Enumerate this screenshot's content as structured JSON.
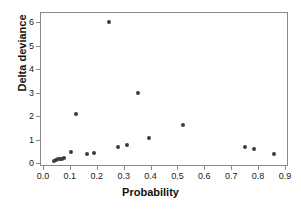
{
  "chart_data": {
    "type": "scatter",
    "title": "",
    "xlabel": "Probability",
    "ylabel": "Delta deviance",
    "xlim": [
      0.0,
      0.9
    ],
    "ylim": [
      0,
      6
    ],
    "xticks": [
      "0.0",
      "0.1",
      "0.2",
      "0.3",
      "0.4",
      "0.5",
      "0.6",
      "0.7",
      "0.8",
      "0.9"
    ],
    "xtick_values": [
      0.0,
      0.1,
      0.2,
      0.3,
      0.4,
      0.5,
      0.6,
      0.7,
      0.8,
      0.9
    ],
    "yticks": [
      "0",
      "1",
      "2",
      "3",
      "4",
      "5",
      "6"
    ],
    "ytick_values": [
      0,
      1,
      2,
      3,
      4,
      5,
      6
    ],
    "grid": false,
    "legend": false,
    "marker_color": "#3d3d3d",
    "frame_color": "#8a8a8a",
    "points": [
      {
        "x": 0.042,
        "y": 0.1
      },
      {
        "x": 0.05,
        "y": 0.13
      },
      {
        "x": 0.057,
        "y": 0.15
      },
      {
        "x": 0.063,
        "y": 0.17
      },
      {
        "x": 0.07,
        "y": 0.19
      },
      {
        "x": 0.077,
        "y": 0.21
      },
      {
        "x": 0.105,
        "y": 0.47
      },
      {
        "x": 0.123,
        "y": 2.1
      },
      {
        "x": 0.163,
        "y": 0.38
      },
      {
        "x": 0.19,
        "y": 0.41
      },
      {
        "x": 0.245,
        "y": 6.0
      },
      {
        "x": 0.278,
        "y": 0.68
      },
      {
        "x": 0.313,
        "y": 0.78
      },
      {
        "x": 0.353,
        "y": 3.0
      },
      {
        "x": 0.393,
        "y": 1.05
      },
      {
        "x": 0.52,
        "y": 1.6
      },
      {
        "x": 0.75,
        "y": 0.67
      },
      {
        "x": 0.783,
        "y": 0.58
      },
      {
        "x": 0.858,
        "y": 0.37
      }
    ]
  }
}
